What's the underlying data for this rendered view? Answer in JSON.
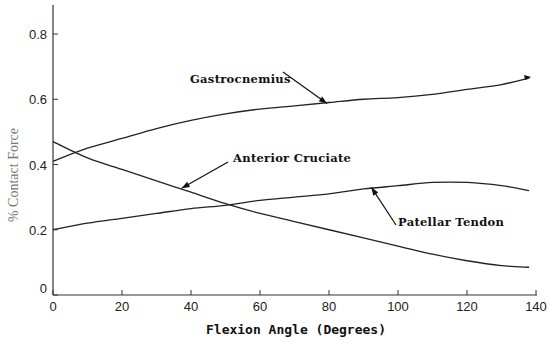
{
  "chart_data": {
    "type": "line",
    "title": "",
    "xlabel": "Flexion Angle (Degrees)",
    "ylabel": "% Contact Force",
    "xlim": [
      0,
      140
    ],
    "ylim": [
      0,
      0.8
    ],
    "xticks": [
      "0",
      "20",
      "40",
      "60",
      "80",
      "100",
      "120",
      "140"
    ],
    "yticks": [
      "0",
      "0.2",
      "0.4",
      "0.6",
      "0.8"
    ],
    "grid": false,
    "legend": "none (inline arrow annotations)",
    "x": [
      0,
      10,
      20,
      30,
      40,
      50,
      60,
      70,
      80,
      90,
      100,
      110,
      120,
      130,
      138
    ],
    "series": [
      {
        "name": "Gastrocnemius",
        "values": [
          0.41,
          0.45,
          0.48,
          0.51,
          0.535,
          0.555,
          0.57,
          0.58,
          0.59,
          0.6,
          0.605,
          0.615,
          0.63,
          0.645,
          0.665
        ]
      },
      {
        "name": "Anterior Cruciate",
        "values": [
          0.47,
          0.42,
          0.385,
          0.35,
          0.315,
          0.28,
          0.25,
          0.225,
          0.2,
          0.175,
          0.15,
          0.125,
          0.105,
          0.09,
          0.085
        ]
      },
      {
        "name": "Patellar Tendon",
        "values": [
          0.2,
          0.22,
          0.235,
          0.25,
          0.265,
          0.275,
          0.29,
          0.3,
          0.31,
          0.325,
          0.335,
          0.345,
          0.345,
          0.335,
          0.32
        ]
      }
    ],
    "annotations": [
      {
        "text": "Gastrocnemius",
        "arrow_to_x": 80,
        "arrow_to_y": 0.59
      },
      {
        "text": "Anterior Cruciate",
        "arrow_to_x": 37,
        "arrow_to_y": 0.33
      },
      {
        "text": "Patellar Tendon",
        "arrow_to_x": 92,
        "arrow_to_y": 0.33
      }
    ]
  },
  "labels": {
    "xlabel": "Flexion Angle (Degrees)",
    "ylabel": "% Contact Force",
    "annot_gastro": "Gastrocnemius",
    "annot_acl": "Anterior Cruciate",
    "annot_patellar": "Patellar Tendon"
  }
}
